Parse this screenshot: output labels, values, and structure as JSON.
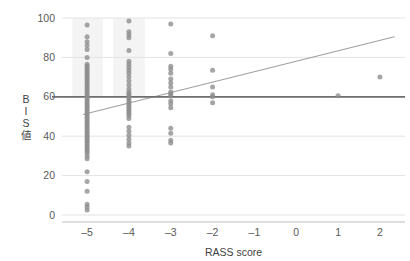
{
  "chart_data": {
    "type": "scatter",
    "title": "",
    "xlabel": "RASS score",
    "ylabel": "BIS値",
    "ylabel_chars": [
      "B",
      "I",
      "S",
      "値"
    ],
    "xlim": [
      -5.6,
      2.6
    ],
    "ylim": [
      0,
      100
    ],
    "xticks": [
      -5,
      -4,
      -3,
      -2,
      -1,
      0,
      1,
      2
    ],
    "xtick_labels": [
      "–5",
      "–4",
      "–3",
      "–2",
      "–1",
      "0",
      "1",
      "2"
    ],
    "yticks": [
      0,
      20,
      40,
      60,
      80,
      100
    ],
    "ytick_labels": [
      "0",
      "20",
      "40",
      "60",
      "80",
      "100"
    ],
    "grid": "horizontal",
    "legend": "none",
    "colors": {
      "point": "#8c8c8c",
      "grid": "#e3e3e3",
      "reference_line": "#6e6e6e",
      "trend_line": "#8f8f8f",
      "axis": "#bdbdbd",
      "text": "#595959",
      "shade_band": "#f4f4f4",
      "background": "#ffffff"
    },
    "reference_line": {
      "orientation": "horizontal",
      "y": 60,
      "label": "BIS 60"
    },
    "trend_line": {
      "kind": "linear-regression",
      "x0": -5.1,
      "y0": 51.0,
      "x1": 2.35,
      "y1": 90.5
    },
    "shade_bands": [
      {
        "x0": -5.35,
        "x1": -4.62,
        "y0": 60,
        "y1": 100
      },
      {
        "x0": -4.38,
        "x1": -3.62,
        "y0": 60,
        "y1": 100
      }
    ],
    "series": [
      {
        "name": "patients",
        "points": [
          [
            -5,
            96.5
          ],
          [
            -5,
            90.5
          ],
          [
            -5,
            88.0
          ],
          [
            -5,
            86.0
          ],
          [
            -5,
            84.0
          ],
          [
            -5,
            80.0
          ],
          [
            -5,
            76.5
          ],
          [
            -5,
            75.5
          ],
          [
            -5,
            74.5
          ],
          [
            -5,
            73.5
          ],
          [
            -5,
            72.5
          ],
          [
            -5,
            71.5
          ],
          [
            -5,
            70.5
          ],
          [
            -5,
            69.5
          ],
          [
            -5,
            68.5
          ],
          [
            -5,
            67.5
          ],
          [
            -5,
            66.5
          ],
          [
            -5,
            65.5
          ],
          [
            -5,
            64.5
          ],
          [
            -5,
            63.5
          ],
          [
            -5,
            62.5
          ],
          [
            -5,
            61.5
          ],
          [
            -5,
            60.5
          ],
          [
            -5,
            59.5
          ],
          [
            -5,
            58.5
          ],
          [
            -5,
            57.5
          ],
          [
            -5,
            56.5
          ],
          [
            -5,
            55.5
          ],
          [
            -5,
            54.5
          ],
          [
            -5,
            53.5
          ],
          [
            -5,
            52.5
          ],
          [
            -5,
            51.5
          ],
          [
            -5,
            50.5
          ],
          [
            -5,
            49.5
          ],
          [
            -5,
            48.5
          ],
          [
            -5,
            47.5
          ],
          [
            -5,
            46.5
          ],
          [
            -5,
            45.5
          ],
          [
            -5,
            44.5
          ],
          [
            -5,
            43.5
          ],
          [
            -5,
            42.5
          ],
          [
            -5,
            41.5
          ],
          [
            -5,
            40.5
          ],
          [
            -5,
            39.5
          ],
          [
            -5,
            38.5
          ],
          [
            -5,
            37.5
          ],
          [
            -5,
            36.5
          ],
          [
            -5,
            35.5
          ],
          [
            -5,
            34.5
          ],
          [
            -5,
            33.5
          ],
          [
            -5,
            32.5
          ],
          [
            -5,
            31.5
          ],
          [
            -5,
            30.0
          ],
          [
            -5,
            28.5
          ],
          [
            -5,
            22.0
          ],
          [
            -5,
            17.0
          ],
          [
            -5,
            12.0
          ],
          [
            -5,
            5.5
          ],
          [
            -5,
            4.0
          ],
          [
            -5,
            2.5
          ],
          [
            -4,
            98.5
          ],
          [
            -4,
            93.0
          ],
          [
            -4,
            91.5
          ],
          [
            -4,
            90.0
          ],
          [
            -4,
            83.5
          ],
          [
            -4,
            78.0
          ],
          [
            -4,
            76.5
          ],
          [
            -4,
            75.0
          ],
          [
            -4,
            73.5
          ],
          [
            -4,
            72.0
          ],
          [
            -4,
            70.0
          ],
          [
            -4,
            68.0
          ],
          [
            -4,
            66.0
          ],
          [
            -4,
            64.0
          ],
          [
            -4,
            62.5
          ],
          [
            -4,
            61.5
          ],
          [
            -4,
            60.5
          ],
          [
            -4,
            59.5
          ],
          [
            -4,
            58.5
          ],
          [
            -4,
            57.5
          ],
          [
            -4,
            56.5
          ],
          [
            -4,
            55.5
          ],
          [
            -4,
            54.5
          ],
          [
            -4,
            53.5
          ],
          [
            -4,
            52.5
          ],
          [
            -4,
            51.5
          ],
          [
            -4,
            50.5
          ],
          [
            -4,
            49.0
          ],
          [
            -4,
            44.5
          ],
          [
            -4,
            42.5
          ],
          [
            -4,
            40.5
          ],
          [
            -4,
            38.5
          ],
          [
            -4,
            36.5
          ],
          [
            -4,
            35.0
          ],
          [
            -3,
            97.0
          ],
          [
            -3,
            82.0
          ],
          [
            -3,
            75.5
          ],
          [
            -3,
            74.0
          ],
          [
            -3,
            72.0
          ],
          [
            -3,
            69.0
          ],
          [
            -3,
            67.0
          ],
          [
            -3,
            65.0
          ],
          [
            -3,
            62.5
          ],
          [
            -3,
            61.5
          ],
          [
            -3,
            60.5
          ],
          [
            -3,
            58.0
          ],
          [
            -3,
            56.5
          ],
          [
            -3,
            54.5
          ],
          [
            -3,
            44.0
          ],
          [
            -3,
            41.5
          ],
          [
            -3,
            38.0
          ],
          [
            -3,
            36.5
          ],
          [
            -2,
            91.0
          ],
          [
            -2,
            73.5
          ],
          [
            -2,
            65.0
          ],
          [
            -2,
            61.0
          ],
          [
            -2,
            60.0
          ],
          [
            -2,
            57.0
          ],
          [
            1,
            60.5
          ],
          [
            2,
            70.0
          ]
        ]
      }
    ]
  }
}
